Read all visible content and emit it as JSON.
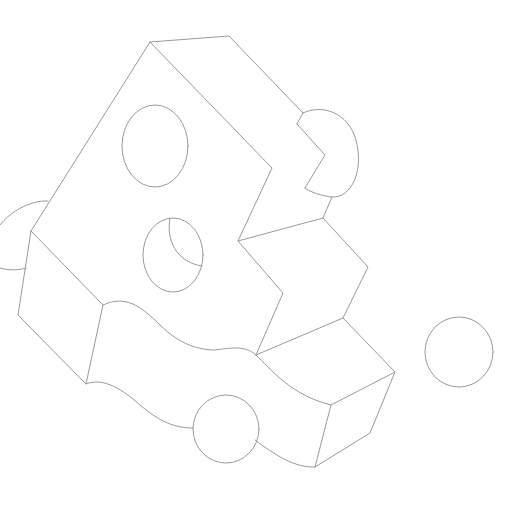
{
  "canvas": {
    "width": 506,
    "height": 507,
    "background": "#ffffff"
  },
  "style": {
    "stroke": "#9a9a9a",
    "stroke_width": 1
  },
  "drawing": {
    "description": "Line-art isometric cheese-like block with circular holes and detached round pieces",
    "shapes": {
      "top_face_edge": "M150 42 L229 36 L303 113",
      "main_left_edge": "M150 42 L31 231",
      "inner_diagonal": "M150 42 L272 168 L238 241 L283 293 L256 355",
      "right_notch_piece": "M297 124 L325 155 L305 188",
      "right_notch_arc": "M303 113 C322 104 348 112 356 140 C364 170 352 198 332 197 C322 196 310 192 305 188",
      "right_notch_arc_top": "M297 124 C300 118 302 115 303 113",
      "connector_mid": "M332 197 L323 218 L238 241",
      "middle_step": "M323 218 L368 267 L343 318 L256 355",
      "lower_step": "M343 318 L395 372 L331 405 L315 467",
      "lower_right_face": "M395 372 L370 433 L315 467",
      "left_block": "M31 231 L18 315 L86 384 L103 305 L31 231",
      "wavy_top": "M103 305 C125 295 140 305 160 325 C180 345 200 350 215 350 C230 348 245 345 256 355 C270 368 290 395 331 405",
      "wavy_bottom_left": "M86 384 C100 378 118 385 140 405 C160 422 175 428 193 428",
      "wavy_bottom_right": "M255 440 C275 455 295 468 315 467",
      "left_partial_arc_top": "M48 201 C30 200 10 212 0 225",
      "left_partial_arc_bottom": "M0 268 C10 271 20 270 26 268"
    },
    "ellipses": {
      "top_hole": {
        "cx": 155,
        "cy": 146,
        "rx": 33,
        "ry": 41
      },
      "middle_hole": {
        "cx": 173,
        "cy": 255,
        "rx": 30,
        "ry": 37
      },
      "bottom_ball": {
        "cx": 226,
        "cy": 429,
        "rx": 33,
        "ry": 34
      },
      "right_ball": {
        "cx": 459,
        "cy": 352,
        "rx": 34,
        "ry": 35
      }
    },
    "middle_hole_inner_arc": "M170 218 C166 240 176 262 202 266"
  }
}
